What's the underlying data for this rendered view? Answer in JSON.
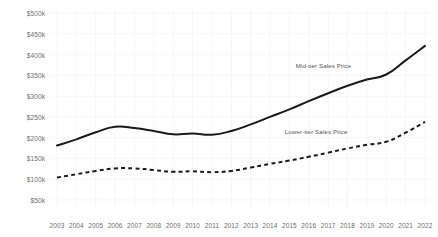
{
  "chart_data": {
    "type": "line",
    "title": "",
    "xlabel": "",
    "ylabel": "",
    "grid": true,
    "legend_position": "inline-annotation",
    "x": [
      2003,
      2004,
      2005,
      2006,
      2007,
      2008,
      2009,
      2010,
      2011,
      2012,
      2013,
      2014,
      2015,
      2016,
      2017,
      2018,
      2019,
      2020,
      2021,
      2022
    ],
    "xtick_labels": [
      "2003",
      "2004",
      "2005",
      "2006",
      "2007",
      "2008",
      "2009",
      "2010",
      "2011",
      "2012",
      "2013",
      "2014",
      "2015",
      "2016",
      "2017",
      "2018",
      "2019",
      "2020",
      "2021",
      "2022"
    ],
    "ytick_labels": [
      "$500k",
      "$450k",
      "$400k",
      "$350k",
      "$300k",
      "$250k",
      "$200k",
      "$150k",
      "$100k",
      "$50k"
    ],
    "ytick_values": [
      500000,
      450000,
      400000,
      350000,
      300000,
      250000,
      200000,
      150000,
      100000,
      50000
    ],
    "ylim": [
      25000,
      512000
    ],
    "xlim": [
      2003,
      2022
    ],
    "series": [
      {
        "name": "Mid-tier Sales Price",
        "style": "solid",
        "color": "#1a1a1a",
        "label_x": 2018.2,
        "label_y": 372000,
        "values": [
          181000,
          196000,
          213000,
          226000,
          223000,
          216000,
          208000,
          210000,
          207000,
          216000,
          232000,
          250000,
          268000,
          288000,
          307000,
          325000,
          340000,
          352000,
          386000,
          421000
        ]
      },
      {
        "name": "Lower-tier Sales Price",
        "style": "dashed",
        "color": "#1a1a1a",
        "label_x": 2018.0,
        "label_y": 213000,
        "values": [
          104000,
          112000,
          120000,
          126000,
          126000,
          122000,
          118000,
          119000,
          117000,
          120000,
          128000,
          137000,
          145000,
          154000,
          164000,
          174000,
          183000,
          190000,
          212000,
          238000
        ]
      }
    ]
  }
}
